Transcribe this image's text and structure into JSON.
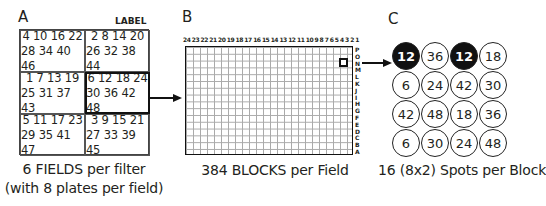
{
  "panelA": {
    "letter": "A",
    "label_tag": "LABEL",
    "fields": [
      {
        "line1": "4 10 16 22",
        "line2": "28 34 40 46",
        "selected": false
      },
      {
        "line1": "2 8 14 20",
        "line2": "26 32 38 44",
        "selected": false
      },
      {
        "line1": "1 7 13 19",
        "line2": "25 31 37 43",
        "selected": false
      },
      {
        "line1": "6 12 18 24",
        "line2": "30 36 42 48",
        "selected": true
      },
      {
        "line1": "5 11 17 23",
        "line2": "29 35 41 47",
        "selected": false
      },
      {
        "line1": "3 9 15 21",
        "line2": "27 33 39 45",
        "selected": false
      }
    ],
    "caption_line1": "6 FIELDS per filter",
    "caption_line2": "(with 8 plates per field)"
  },
  "panelB": {
    "letter": "B",
    "columns": [
      "24",
      "23",
      "22",
      "21",
      "20",
      "19",
      "18",
      "17",
      "16",
      "15",
      "14",
      "13",
      "12",
      "11",
      "10",
      "9",
      "8",
      "7",
      "6",
      "5",
      "4",
      "3",
      "2",
      "1"
    ],
    "rows": [
      "P",
      "O",
      "N",
      "M",
      "L",
      "K",
      "J",
      "I",
      "H",
      "G",
      "F",
      "E",
      "D",
      "C",
      "B",
      "A"
    ],
    "selected_block": {
      "column": "2",
      "row": "N"
    },
    "caption": "384 BLOCKS per Field"
  },
  "panelC": {
    "letter": "C",
    "spots": [
      {
        "value": "12",
        "filled": true
      },
      {
        "value": "36",
        "filled": false
      },
      {
        "value": "12",
        "filled": true
      },
      {
        "value": "18",
        "filled": false
      },
      {
        "value": "6",
        "filled": false
      },
      {
        "value": "24",
        "filled": false
      },
      {
        "value": "42",
        "filled": false
      },
      {
        "value": "30",
        "filled": false
      },
      {
        "value": "42",
        "filled": false
      },
      {
        "value": "48",
        "filled": false
      },
      {
        "value": "18",
        "filled": false
      },
      {
        "value": "36",
        "filled": false
      },
      {
        "value": "6",
        "filled": false
      },
      {
        "value": "30",
        "filled": false
      },
      {
        "value": "24",
        "filled": false
      },
      {
        "value": "48",
        "filled": false
      }
    ],
    "caption": "16 (8x2) Spots per Block"
  }
}
